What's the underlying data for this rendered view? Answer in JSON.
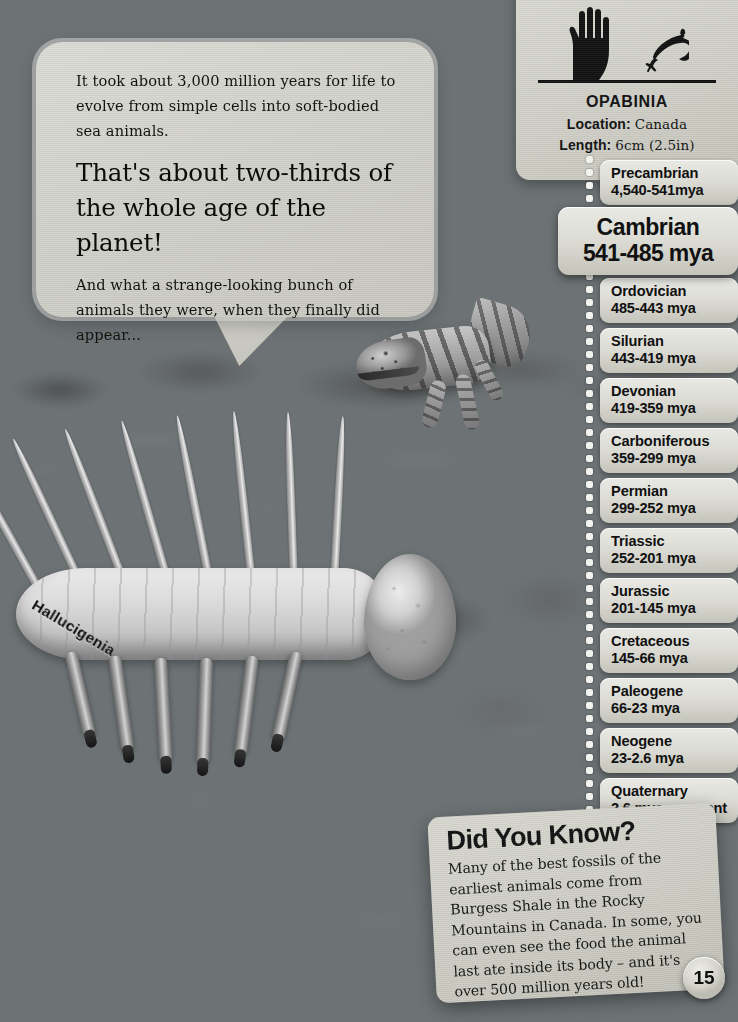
{
  "page": {
    "number": "15",
    "background_description": "underwater-seabed-scene"
  },
  "speech_bubble": {
    "paragraph_1": "It took about 3,000 million years for life to evolve from simple cells into soft-bodied sea animals.",
    "headline": "That's about two-thirds of the whole age of the planet!",
    "paragraph_2": "And what a strange-looking bunch of animals they were, when they finally did appear..."
  },
  "creature_label": "Hallucigenia",
  "info_card": {
    "title": "OPABINIA",
    "location_label": "Location:",
    "location_value": "Canada",
    "length_label": "Length:",
    "length_value": "6cm (2.5in)",
    "scale_icons": [
      "hand-icon",
      "opabinia-icon"
    ]
  },
  "timeline": {
    "highlight_index": 1,
    "eras": [
      {
        "name": "Precambrian",
        "range": "4,540-541mya"
      },
      {
        "name": "Cambrian",
        "range": "541-485 mya"
      },
      {
        "name": "Ordovician",
        "range": "485-443 mya"
      },
      {
        "name": "Silurian",
        "range": "443-419 mya"
      },
      {
        "name": "Devonian",
        "range": "419-359 mya"
      },
      {
        "name": "Carboniferous",
        "range": "359-299 mya"
      },
      {
        "name": "Permian",
        "range": "299-252 mya"
      },
      {
        "name": "Triassic",
        "range": "252-201 mya"
      },
      {
        "name": "Jurassic",
        "range": "201-145 mya"
      },
      {
        "name": "Cretaceous",
        "range": "145-66 mya"
      },
      {
        "name": "Paleogene",
        "range": "66-23 mya"
      },
      {
        "name": "Neogene",
        "range": "23-2.6 mya"
      },
      {
        "name": "Quaternary",
        "range": "2.6 mya - present"
      }
    ]
  },
  "did_you_know": {
    "title": "Did You Know?",
    "body": "Many of the best fossils of the earliest animals come from Burgess Shale in the Rocky Mountains in Canada. In some, you can even see the food the animal last ate inside its body – and it's over 500 million years old!"
  },
  "colors": {
    "card_light": "#d8d8d1",
    "card_dark": "#c2c2b9",
    "text": "#111111",
    "water": "#6d7375",
    "sand": "#cfc9bd"
  }
}
